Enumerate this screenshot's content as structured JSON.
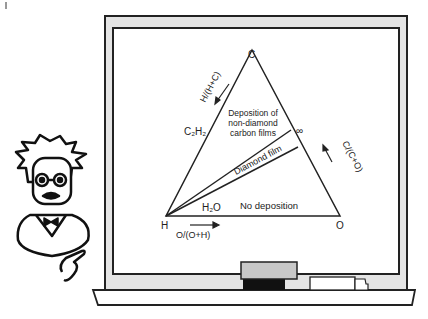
{
  "diagram": {
    "type": "ternary-phase-diagram",
    "vertices": {
      "top": "C",
      "left": "H",
      "right": "O"
    },
    "axis_labels": {
      "left_edge": "H/(H+C)",
      "right_edge": "C/(C+O)",
      "bottom_edge": "O/(O+H)"
    },
    "points": {
      "c2h2": "C₂H₂",
      "h2o": "H₂O",
      "co": "∞"
    },
    "regions": {
      "upper_line1": "Deposition of",
      "upper_line2": "non-diamond",
      "upper_line3": "carbon films",
      "band": "Diamond film",
      "lower": "No deposition"
    }
  },
  "scene": {
    "chalkboard": "chalkboard-frame",
    "character": "professor-cartoon"
  },
  "colors": {
    "ink": "#222222",
    "frame_fill": "#e4e4e4",
    "eraser_top": "#c8c8c8",
    "eraser_base": "#111111"
  }
}
